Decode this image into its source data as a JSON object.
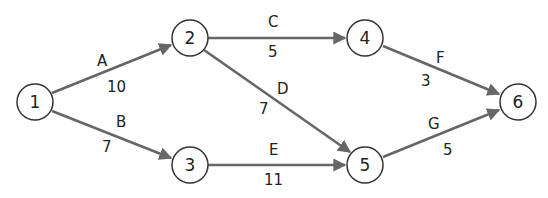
{
  "diagram": {
    "type": "activity-on-arrow network",
    "nodes": [
      {
        "id": "1",
        "label": "1",
        "x": 35,
        "y": 102
      },
      {
        "id": "2",
        "label": "2",
        "x": 190,
        "y": 38
      },
      {
        "id": "3",
        "label": "3",
        "x": 190,
        "y": 165
      },
      {
        "id": "4",
        "label": "4",
        "x": 365,
        "y": 38
      },
      {
        "id": "5",
        "label": "5",
        "x": 365,
        "y": 165
      },
      {
        "id": "6",
        "label": "6",
        "x": 518,
        "y": 102
      }
    ],
    "edges": [
      {
        "from": "1",
        "to": "2",
        "activity": "A",
        "duration": "10"
      },
      {
        "from": "1",
        "to": "3",
        "activity": "B",
        "duration": "7"
      },
      {
        "from": "2",
        "to": "4",
        "activity": "C",
        "duration": "5"
      },
      {
        "from": "2",
        "to": "5",
        "activity": "D",
        "duration": "7"
      },
      {
        "from": "3",
        "to": "5",
        "activity": "E",
        "duration": "11"
      },
      {
        "from": "4",
        "to": "6",
        "activity": "F",
        "duration": "3"
      },
      {
        "from": "5",
        "to": "6",
        "activity": "G",
        "duration": "5"
      }
    ],
    "colors": {
      "edge": "#666666",
      "node_stroke": "#333333",
      "text": "#222222"
    }
  }
}
